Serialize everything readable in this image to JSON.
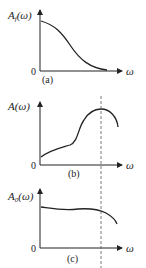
{
  "figure": {
    "panels": [
      {
        "id": "a",
        "caption": "(a)",
        "y_label": {
          "main": "A",
          "sub": "f",
          "arg": "(ω)"
        },
        "origin_label": "0",
        "x_label": "ω",
        "description": "Monotonically decreasing curve from high value at ω=0 to near zero"
      },
      {
        "id": "b",
        "caption": "(b)",
        "y_label": {
          "main": "A",
          "sub": "",
          "arg": "(ω)"
        },
        "origin_label": "0",
        "x_label": "ω",
        "description": "Rising curve with a hump reaching a peak at the dashed line, then falling"
      },
      {
        "id": "c",
        "caption": "(c)",
        "y_label": {
          "main": "A",
          "sub": "0",
          "arg": "(ω)"
        },
        "origin_label": "0",
        "x_label": "ω",
        "description": "Nearly flat curve that drops off after the dashed line"
      }
    ],
    "dashed_line": "vertical reference at peak frequency spanning panels (b) and (c)",
    "colors": {
      "line": "#222222",
      "dashed": "#555555"
    }
  }
}
